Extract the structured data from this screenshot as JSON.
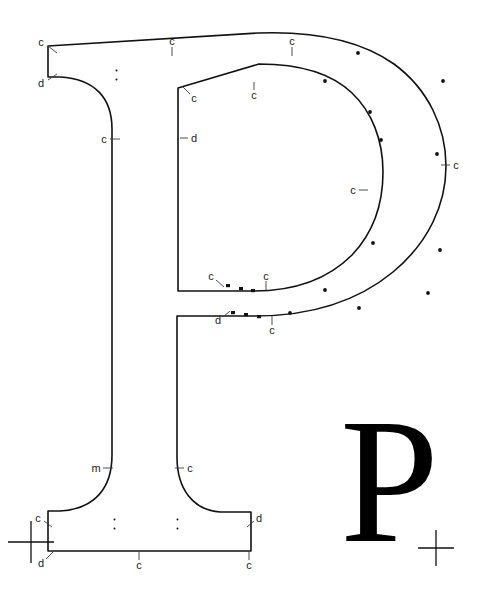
{
  "figure": {
    "kind": "letterform-construction-diagram",
    "glyph": "P",
    "background_color": "#ffffff",
    "ink_color": "#111111",
    "annotation_color": "#1a1a1a",
    "width": 486,
    "height": 595
  },
  "specimen": {
    "character": "P",
    "x": 340,
    "y": 392,
    "font_size": 178,
    "color": "#000000"
  },
  "annotations": [
    {
      "id": "a01",
      "label": "c",
      "x": 41,
      "y": 42,
      "leader": {
        "x1": 48,
        "y1": 46,
        "x2": 57,
        "y2": 53
      }
    },
    {
      "id": "a02",
      "label": "d",
      "x": 41,
      "y": 83,
      "leader": {
        "x1": 48,
        "y1": 80,
        "x2": 57,
        "y2": 74
      }
    },
    {
      "id": "a03",
      "label": "c",
      "x": 172,
      "y": 41,
      "leader": {
        "x1": 172,
        "y1": 47,
        "x2": 172,
        "y2": 56
      }
    },
    {
      "id": "a04",
      "label": "c",
      "x": 292,
      "y": 41,
      "leader": {
        "x1": 292,
        "y1": 47,
        "x2": 292,
        "y2": 56
      }
    },
    {
      "id": "a05",
      "label": "c",
      "x": 104,
      "y": 139,
      "leader": {
        "x1": 110,
        "y1": 139,
        "x2": 120,
        "y2": 139
      }
    },
    {
      "id": "a06",
      "label": "c",
      "x": 194,
      "y": 98,
      "leader": {
        "x1": 190,
        "y1": 94,
        "x2": 183,
        "y2": 87
      }
    },
    {
      "id": "a07",
      "label": "d",
      "x": 194,
      "y": 138,
      "leader": {
        "x1": 188,
        "y1": 138,
        "x2": 180,
        "y2": 138
      }
    },
    {
      "id": "a08",
      "label": "c",
      "x": 254,
      "y": 95,
      "leader": {
        "x1": 254,
        "y1": 90,
        "x2": 254,
        "y2": 82
      }
    },
    {
      "id": "a09",
      "label": "c",
      "x": 456,
      "y": 165,
      "leader": {
        "x1": 450,
        "y1": 165,
        "x2": 441,
        "y2": 165
      }
    },
    {
      "id": "a10",
      "label": "c",
      "x": 353,
      "y": 190,
      "leader": {
        "x1": 359,
        "y1": 190,
        "x2": 368,
        "y2": 190
      }
    },
    {
      "id": "a11",
      "label": "c",
      "x": 211,
      "y": 276,
      "leader": {
        "x1": 216,
        "y1": 280,
        "x2": 224,
        "y2": 287
      }
    },
    {
      "id": "a12",
      "label": "c",
      "x": 266,
      "y": 276,
      "leader": {
        "x1": 266,
        "y1": 281,
        "x2": 266,
        "y2": 290
      }
    },
    {
      "id": "a13",
      "label": "d",
      "x": 218,
      "y": 320,
      "leader": {
        "x1": 223,
        "y1": 317,
        "x2": 230,
        "y2": 311
      }
    },
    {
      "id": "a14",
      "label": "c",
      "x": 272,
      "y": 330,
      "leader": {
        "x1": 272,
        "y1": 325,
        "x2": 272,
        "y2": 316
      }
    },
    {
      "id": "a15",
      "label": "m",
      "x": 96,
      "y": 468,
      "leader": {
        "x1": 103,
        "y1": 468,
        "x2": 113,
        "y2": 468
      }
    },
    {
      "id": "a16",
      "label": "c",
      "x": 190,
      "y": 468,
      "leader": {
        "x1": 184,
        "y1": 468,
        "x2": 175,
        "y2": 468
      }
    },
    {
      "id": "a17",
      "label": "c",
      "x": 38,
      "y": 518,
      "leader": {
        "x1": 44,
        "y1": 521,
        "x2": 52,
        "y2": 527
      }
    },
    {
      "id": "a18",
      "label": "d",
      "x": 41,
      "y": 563,
      "leader": {
        "x1": 46,
        "y1": 559,
        "x2": 53,
        "y2": 552
      }
    },
    {
      "id": "a19",
      "label": "c",
      "x": 139,
      "y": 565,
      "leader": {
        "x1": 139,
        "y1": 560,
        "x2": 139,
        "y2": 551
      }
    },
    {
      "id": "a20",
      "label": "d",
      "x": 259,
      "y": 518,
      "leader": {
        "x1": 254,
        "y1": 521,
        "x2": 247,
        "y2": 527
      }
    },
    {
      "id": "a21",
      "label": "c",
      "x": 249,
      "y": 565,
      "leader": {
        "x1": 249,
        "y1": 560,
        "x2": 249,
        "y2": 551
      }
    }
  ],
  "colon_marks": [
    {
      "id": "cm1",
      "x": 117,
      "y": 75
    },
    {
      "id": "cm2",
      "x": 115,
      "y": 524
    },
    {
      "id": "cm3",
      "x": 178,
      "y": 524
    }
  ],
  "control_dots": [
    {
      "x": 358,
      "y": 53
    },
    {
      "x": 325,
      "y": 81
    },
    {
      "x": 443,
      "y": 81
    },
    {
      "x": 370,
      "y": 112
    },
    {
      "x": 381,
      "y": 140
    },
    {
      "x": 437,
      "y": 154
    },
    {
      "x": 373,
      "y": 243
    },
    {
      "x": 440,
      "y": 250
    },
    {
      "x": 325,
      "y": 290
    },
    {
      "x": 359,
      "y": 308
    },
    {
      "x": 290,
      "y": 313
    },
    {
      "x": 428,
      "y": 293
    }
  ],
  "node_ticks": [
    {
      "x": 228,
      "y": 286
    },
    {
      "x": 240,
      "y": 289
    },
    {
      "x": 252,
      "y": 291
    },
    {
      "x": 233,
      "y": 313
    },
    {
      "x": 246,
      "y": 315
    },
    {
      "x": 259,
      "y": 317
    }
  ],
  "crosshairs": [
    {
      "id": "reg-left",
      "x": 31,
      "y": 542,
      "arm_h": 23,
      "arm_v": 21
    },
    {
      "id": "reg-right",
      "x": 436,
      "y": 548,
      "arm_h": 18,
      "arm_v": 18
    }
  ],
  "paths": {
    "outer_contour": "M 48 47 L 48 77 L 58 77 C 92 78 110 96 110 126 L 110 457 C 110 489 92 510 58 511 L 48 511 L 48 551 L 251 551 L 251 512 L 220 512 C 192 511 176 490 176 458 L 176 315 L 253 315 C 310 315 356 300 389 273 C 425 244 444 204 444 166 C 444 127 426 90 392 65 C 359 42 313 32 259 33 L 48 47 Z",
    "bowl_inner": "M 178 87 L 178 290 L 254 290 C 297 290 328 277 350 255 C 371 234 381 205 381 172 C 381 140 371 113 351 93 C 331 74 302 64 260 64 Z"
  }
}
